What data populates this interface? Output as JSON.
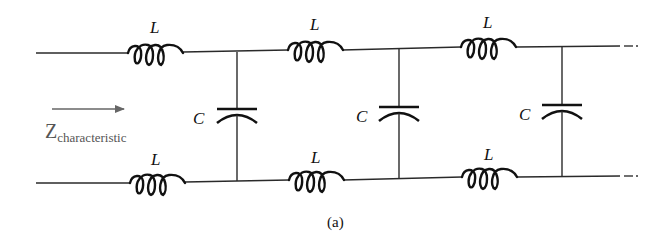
{
  "diagram": {
    "type": "LC ladder transmission-line model",
    "caption": "(a)",
    "impedance_label": {
      "main": "Z",
      "subscript": "characteristic"
    },
    "inductor_label": "L",
    "capacitor_label": "C",
    "sections": [
      {
        "top_inductor": "L",
        "bottom_inductor": "L",
        "shunt_capacitor": "C"
      },
      {
        "top_inductor": "L",
        "bottom_inductor": "L",
        "shunt_capacitor": "C"
      },
      {
        "top_inductor": "L",
        "bottom_inductor": "L",
        "shunt_capacitor": "C"
      }
    ],
    "continuation": "…",
    "colors": {
      "line": "#111111",
      "annotation": "#555555",
      "background": "#ffffff"
    }
  }
}
